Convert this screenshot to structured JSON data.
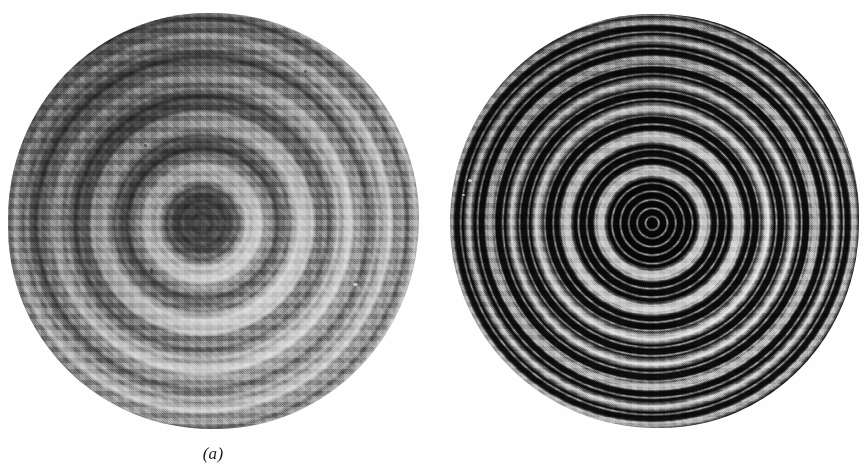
{
  "figure": {
    "kind": "two-panel photographic plate",
    "background_color": "#fefefe",
    "width": 868,
    "height": 473,
    "panels": [
      {
        "id": "a",
        "caption": "(a)",
        "caption_center_x": 213,
        "caption_y": 455,
        "subject": "circular interference fringe pattern (concentric rings)",
        "disc": {
          "center_x": 213,
          "center_y": 221,
          "radius_x": 205,
          "radius_y": 208,
          "left": 8,
          "top": 13,
          "right": 419,
          "bottom": 429
        },
        "appearance": {
          "ground_tone": "mid grey",
          "fringe_contrast": "low, broad soft fringes",
          "center": "broad dark disc",
          "center_dark_radius": 30,
          "visible_ring_count": 26,
          "shading": "darker toward upper-left, lighter toward lower-right",
          "darkest_color": "#3a3a3a",
          "brightest_color": "#d8d8d8"
        }
      },
      {
        "id": "b",
        "caption": "(b)",
        "caption_center_x": 655,
        "caption_y": 455,
        "subject": "circular interference fringe pattern (concentric rings), high finesse",
        "disc": {
          "center_x": 654,
          "center_y": 221,
          "radius_x": 204,
          "radius_y": 207,
          "left": 450,
          "top": 14,
          "right": 858,
          "bottom": 428
        },
        "appearance": {
          "ground_tone": "near black",
          "fringe_contrast": "high, thin sharp bright rings",
          "center": "broad dark disc",
          "center_dark_radius": 44,
          "visible_ring_count": 30,
          "shading": "slightly darker toward upper-left",
          "darkest_color": "#050505",
          "brightest_color": "#d6d6d6"
        }
      }
    ]
  }
}
